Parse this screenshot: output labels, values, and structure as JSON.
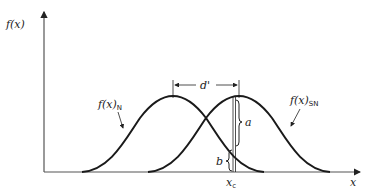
{
  "diagram": {
    "y_axis_label": "f(x)",
    "x_axis_label": "x",
    "curves": [
      {
        "name": "noise",
        "label_main": "f(x)",
        "label_sub": "N",
        "mean_px": 173
      },
      {
        "name": "signal-plus-noise",
        "label_main": "f(x)",
        "label_sub": "SN",
        "mean_px": 239
      }
    ],
    "separation_label": "d'",
    "criterion_label": "x",
    "criterion_sub": "c",
    "brace_upper_label": "a",
    "brace_lower_label": "b",
    "colors": {
      "line": "#1a1a1a",
      "axis": "#555555"
    }
  }
}
